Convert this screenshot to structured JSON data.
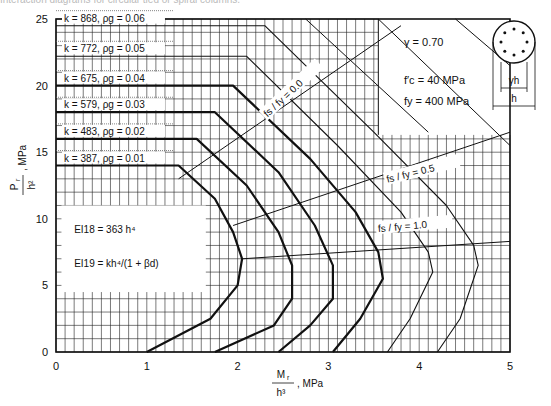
{
  "caption": "Interaction diagrams for circular tied or spiral columns.",
  "chart_data": {
    "type": "line",
    "title": "Interaction diagrams for circular tied or spiral columns",
    "xlabel": "M_r / h^3 , MPa",
    "ylabel": "P_r / h^2 , MPa",
    "xlim": [
      0,
      5
    ],
    "ylim": [
      0,
      25
    ],
    "x_ticks": [
      "0",
      "1",
      "2",
      "3",
      "4",
      "5"
    ],
    "y_ticks": [
      "0",
      "5",
      "10",
      "15",
      "20",
      "25"
    ],
    "grid": true,
    "grid_minor_step_x": 0.1,
    "grid_minor_step_y": 1,
    "parameters": {
      "gamma": "γ  = 0.70",
      "fc": "f′c =  40  MPa",
      "fy": "fy = 400  MPa"
    },
    "section_labels": {
      "gamma_h": "γh",
      "h": "h"
    },
    "annotations": {
      "ei18": "EI18 = 363 h⁴",
      "ei19": "EI19 = kh⁴/(1 + βd)",
      "fs0": "fs / fy = 0.0",
      "fs05": "fs / fy = 0.5",
      "fs10": "fs / fy = 1.0"
    },
    "series": [
      {
        "name": "k = 387, ρg = 0.01",
        "k": 387,
        "rho_g": 0.01,
        "width": 2.2,
        "points": [
          [
            0,
            14
          ],
          [
            1.35,
            14
          ],
          [
            1.75,
            11.5
          ],
          [
            1.95,
            9
          ],
          [
            2.05,
            7
          ],
          [
            2.0,
            5
          ],
          [
            1.7,
            2.5
          ],
          [
            1.0,
            0
          ]
        ]
      },
      {
        "name": "k = 483, ρg = 0.02",
        "k": 483,
        "rho_g": 0.02,
        "width": 2.2,
        "points": [
          [
            0,
            16
          ],
          [
            1.55,
            16
          ],
          [
            2.1,
            12.5
          ],
          [
            2.45,
            9
          ],
          [
            2.6,
            6.5
          ],
          [
            2.6,
            4
          ],
          [
            2.4,
            2
          ],
          [
            1.75,
            0
          ]
        ]
      },
      {
        "name": "k = 579, ρg = 0.03",
        "k": 579,
        "rho_g": 0.03,
        "width": 2.2,
        "points": [
          [
            0,
            18
          ],
          [
            1.75,
            18
          ],
          [
            2.45,
            13.5
          ],
          [
            2.85,
            9.5
          ],
          [
            3.05,
            6.5
          ],
          [
            3.05,
            4
          ],
          [
            2.8,
            2
          ],
          [
            2.45,
            0
          ]
        ]
      },
      {
        "name": "k = 675, ρg = 0.04",
        "k": 675,
        "rho_g": 0.04,
        "width": 2.2,
        "points": [
          [
            0,
            20
          ],
          [
            1.95,
            20
          ],
          [
            2.8,
            14.5
          ],
          [
            3.3,
            10.5
          ],
          [
            3.55,
            7.5
          ],
          [
            3.6,
            5.5
          ],
          [
            3.35,
            2.5
          ],
          [
            3.05,
            0
          ]
        ]
      },
      {
        "name": "k = 772, ρg = 0.05",
        "k": 772,
        "rho_g": 0.05,
        "width": 1.1,
        "points": [
          [
            0,
            22.2
          ],
          [
            2.1,
            22.2
          ],
          [
            3.1,
            15.5
          ],
          [
            3.8,
            10.5
          ],
          [
            4.1,
            7.5
          ],
          [
            4.15,
            6
          ],
          [
            3.9,
            2.5
          ],
          [
            3.65,
            0
          ]
        ]
      },
      {
        "name": "k = 868, ρg = 0.06",
        "k": 868,
        "rho_g": 0.06,
        "width": 1.1,
        "points": [
          [
            0,
            24.5
          ],
          [
            2.3,
            24.5
          ],
          [
            3.5,
            16.5
          ],
          [
            4.3,
            11
          ],
          [
            4.6,
            8
          ],
          [
            4.65,
            6.5
          ],
          [
            4.45,
            2.5
          ],
          [
            4.2,
            0
          ]
        ]
      }
    ],
    "ratio_lines": [
      {
        "name": "fs / fy = 0.0",
        "points": [
          [
            1.35,
            13
          ],
          [
            3.8,
            24.5
          ]
        ]
      },
      {
        "name": "fs / fy = 0.5",
        "points": [
          [
            1.95,
            9.5
          ],
          [
            5,
            16.5
          ]
        ]
      },
      {
        "name": "fs / fy = 1.0",
        "points": [
          [
            2.05,
            7
          ],
          [
            5,
            8.3
          ]
        ]
      }
    ],
    "thin_extra_lines": [
      {
        "points": [
          [
            2.75,
            25
          ],
          [
            4.1,
            16.5
          ]
        ]
      },
      {
        "points": [
          [
            3.55,
            25
          ],
          [
            5,
            15.5
          ]
        ]
      },
      {
        "points": [
          [
            4.4,
            25
          ],
          [
            5,
            21.5
          ]
        ]
      }
    ]
  }
}
